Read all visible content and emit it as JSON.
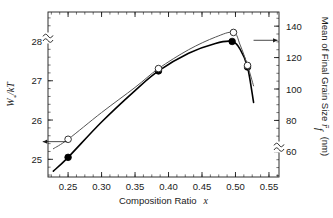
{
  "chart_data": {
    "type": "line",
    "title": "",
    "xlabel": "Composition Ratio  x",
    "xlabel_text": "Composition Ratio",
    "xlabel_symbol": "x",
    "xlim": [
      0.22,
      0.565
    ],
    "xticks": [
      0.25,
      0.3,
      0.35,
      0.4,
      0.45,
      0.5,
      0.55
    ],
    "xticklabels": [
      "0.25",
      "0.30",
      "0.35",
      "0.40",
      "0.45",
      "0.50",
      "0.55"
    ],
    "grid": false,
    "legend": "none",
    "left_axis": {
      "label": "W*/kT",
      "label_main": "W",
      "label_sub": "*",
      "label_rest": "/kT",
      "ylim": [
        24.55,
        28.75
      ],
      "ticks": [
        25,
        26,
        27,
        28
      ],
      "ticklabels": [
        "25",
        "26",
        "27",
        "28"
      ],
      "axis_break": true,
      "axis_break_position": "top"
    },
    "right_axis": {
      "label": "Mean of Final Grain Size  r̄f  (nm)",
      "label_main": "Mean of Final Grain Size",
      "label_symbol": "r̄",
      "label_symbol_sub": "f",
      "label_units": "(nm)",
      "ylim": [
        44,
        149
      ],
      "ticks": [
        60,
        80,
        100,
        120,
        140
      ],
      "ticklabels": [
        "60",
        "80",
        "100",
        "120",
        "140"
      ],
      "axis_break": true,
      "axis_break_position": "bottom"
    },
    "series": [
      {
        "name": "W*/kT",
        "axis": "left",
        "marker": "filled-circle",
        "color": "#000000",
        "linewidth": 1.6,
        "x": [
          0.25,
          0.385,
          0.495,
          0.518
        ],
        "values": [
          25.05,
          27.25,
          28.0,
          27.35
        ],
        "curve_x": [
          0.228,
          0.25,
          0.3,
          0.35,
          0.385,
          0.43,
          0.47,
          0.495,
          0.507,
          0.518,
          0.527
        ],
        "curve_y": [
          24.7,
          25.05,
          25.95,
          26.75,
          27.25,
          27.7,
          27.95,
          28.0,
          27.8,
          27.35,
          26.45
        ]
      },
      {
        "name": "Mean of Final Grain Size",
        "axis": "right",
        "marker": "open-circle",
        "color": "#555555",
        "linewidth": 1.0,
        "x": [
          0.25,
          0.385,
          0.497,
          0.518
        ],
        "values": [
          68,
          113,
          136,
          115
        ],
        "curve_x": [
          0.228,
          0.25,
          0.3,
          0.35,
          0.385,
          0.43,
          0.47,
          0.497,
          0.507,
          0.518,
          0.527
        ],
        "curve_y": [
          62,
          68,
          85,
          101,
          113,
          125,
          133,
          136,
          128,
          115,
          102
        ]
      }
    ],
    "annotations": [
      {
        "name": "left-axis-arrow",
        "direction": "left",
        "points_to": "left-axis",
        "refers_to_series": "W*/kT",
        "data_x": 0.248,
        "data_y_left": 25.45
      },
      {
        "name": "right-axis-arrow",
        "direction": "right",
        "points_to": "right-axis",
        "refers_to_series": "Mean of Final Grain Size",
        "data_x": 0.527,
        "data_y_right": 131
      }
    ]
  }
}
